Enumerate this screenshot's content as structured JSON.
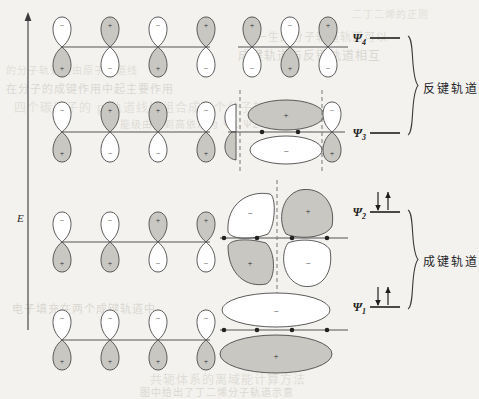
{
  "figure": {
    "energy_axis_label": "E",
    "group_labels": {
      "antibonding": "反键轨道",
      "bonding": "成键轨道"
    },
    "background_color": "#f3f2ee",
    "lobe_fill_positive": "#c9c7c2",
    "lobe_fill_negative": "#ffffff",
    "stroke_color": "#4a4a4a"
  },
  "bleed_text": [
    {
      "text": "二丁二烯的正则",
      "x": 352,
      "y": 6
    },
    {
      "text": "一生的分子轨道轨道可以",
      "x": 256,
      "y": 28
    },
    {
      "text": "成键轨道与反键轨道相互",
      "x": 238,
      "y": 46
    },
    {
      "text": "的分子轨道是由原子轨道线",
      "x": 6,
      "y": 62
    },
    {
      "text": "在分子的成键作用中起主要作用",
      "x": 6,
      "y": 80
    },
    {
      "text": "四个碳原子的 p 轨道线性组合成四个分子轨道",
      "x": 14,
      "y": 98
    },
    {
      "text": "能级由低到高依次为 Ψ1 Ψ2 Ψ3 Ψ4",
      "x": 120,
      "y": 116
    },
    {
      "text": "电子填充在两个成键轨道中",
      "x": 12,
      "y": 300
    },
    {
      "text": "共轭体系的离域能计算方法",
      "x": 150,
      "y": 370
    },
    {
      "text": "图中给出了丁二烯分子轨道示意",
      "x": 140,
      "y": 384
    }
  ],
  "orbitals": [
    {
      "id": "psi4",
      "label": "Ψ",
      "subscript": "4",
      "group": "antibonding",
      "electrons": 0,
      "ao_phases_top": [
        "-",
        "+",
        "-",
        "+"
      ],
      "ao_phases_bottom": [
        "+",
        "-",
        "+",
        "-"
      ],
      "mo_nodes": 3,
      "mo_phases_top": [
        "+",
        "-",
        "+"
      ],
      "mo_phases_bottom": [
        "-",
        "+",
        "-"
      ]
    },
    {
      "id": "psi3",
      "label": "Ψ",
      "subscript": "3",
      "group": "antibonding",
      "electrons": 0,
      "ao_phases_top": [
        "-",
        "+",
        "+",
        "-"
      ],
      "ao_phases_bottom": [
        "+",
        "-",
        "-",
        "+"
      ],
      "mo_nodes": 2,
      "mo_phases_top": [
        "-",
        "+",
        "-"
      ],
      "mo_phases_bottom": [
        "+",
        "-",
        "+"
      ]
    },
    {
      "id": "psi2",
      "label": "Ψ",
      "subscript": "2",
      "group": "bonding",
      "electrons": 2,
      "ao_phases_top": [
        "-",
        "-",
        "+",
        "+"
      ],
      "ao_phases_bottom": [
        "+",
        "+",
        "-",
        "-"
      ],
      "mo_nodes": 1,
      "mo_phases_top": [
        "-",
        "+"
      ],
      "mo_phases_bottom": [
        "+",
        "-"
      ]
    },
    {
      "id": "psi1",
      "label": "Ψ",
      "subscript": "1",
      "group": "bonding",
      "electrons": 2,
      "ao_phases_top": [
        "-",
        "-",
        "-",
        "-"
      ],
      "ao_phases_bottom": [
        "+",
        "+",
        "+",
        "+"
      ],
      "mo_nodes": 0,
      "mo_phases_top": [
        "-"
      ],
      "mo_phases_bottom": [
        "+"
      ]
    }
  ],
  "signs": {
    "positive": "+",
    "negative": "−"
  },
  "electron_arrows": {
    "down": "↓",
    "up": "↑"
  }
}
